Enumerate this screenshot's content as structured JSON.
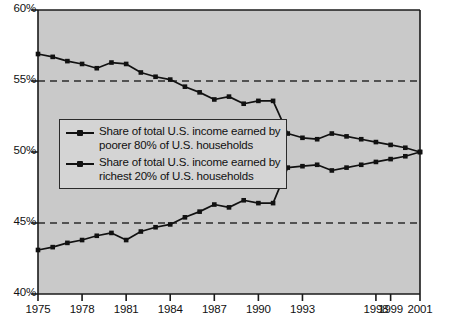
{
  "chart_data": {
    "type": "line",
    "title": "",
    "xlabel": "",
    "ylabel": "",
    "ylim": [
      40,
      60
    ],
    "ytick_labels": [
      "60%",
      "55%",
      "50%",
      "45%",
      "40%"
    ],
    "ytick_values": [
      60,
      55,
      50,
      45,
      40
    ],
    "xtick_labels": [
      "1975",
      "1978",
      "1981",
      "1984",
      "1987",
      "1990",
      "1993",
      "1998",
      "1999",
      "2001"
    ],
    "xtick_values": [
      1975,
      1978,
      1981,
      1984,
      1987,
      1990,
      1993,
      1998,
      1999,
      2001
    ],
    "grid": "horizontal dashed at 55% and 45%",
    "legend_position": "center-left inside plot",
    "plot_background": "#c9c9c9",
    "line_color": "#111111",
    "x": [
      1975,
      1976,
      1977,
      1978,
      1979,
      1980,
      1981,
      1982,
      1983,
      1984,
      1985,
      1986,
      1987,
      1988,
      1989,
      1990,
      1991,
      1992,
      1993,
      1994,
      1995,
      1996,
      1997,
      1998,
      1999,
      2000,
      2001
    ],
    "series": [
      {
        "name": "Share of total U.S. income earned by poorer 80% of U.S. households",
        "legend_line1": "Share of total U.S. income earned by",
        "legend_line2": "poorer 80% of U.S. households",
        "values": [
          56.9,
          56.7,
          56.4,
          56.2,
          55.9,
          56.3,
          56.2,
          55.6,
          55.3,
          55.1,
          54.6,
          54.2,
          53.7,
          53.9,
          53.4,
          53.6,
          53.6,
          51.3,
          51.0,
          50.9,
          51.3,
          51.1,
          50.9,
          50.7,
          50.5,
          50.3,
          50.0
        ]
      },
      {
        "name": "Share of total U.S. income earned by richest 20% of U.S. households",
        "legend_line1": "Share of total U.S. income earned by",
        "legend_line2": "richest 20% of U.S. households",
        "values": [
          43.1,
          43.3,
          43.6,
          43.8,
          44.1,
          44.3,
          43.8,
          44.4,
          44.7,
          44.9,
          45.4,
          45.8,
          46.3,
          46.1,
          46.6,
          46.4,
          46.4,
          48.9,
          49.0,
          49.1,
          48.7,
          48.9,
          49.1,
          49.3,
          49.5,
          49.7,
          50.0
        ]
      }
    ]
  }
}
